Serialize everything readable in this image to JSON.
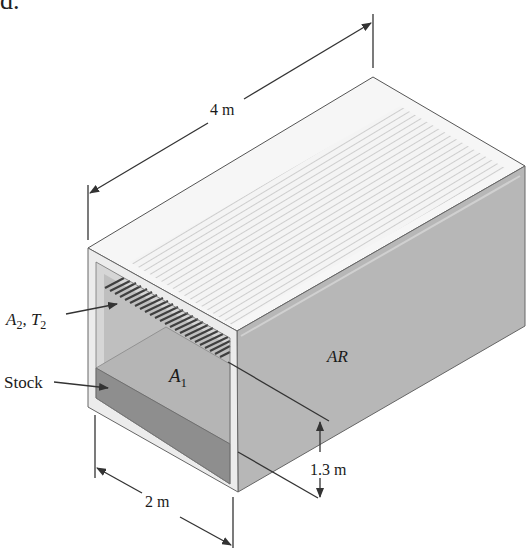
{
  "partial_text_top": "d.",
  "labels": {
    "length": "4 m",
    "width": "2 m",
    "height": "1.3 m",
    "stock": "Stock",
    "a1": "A",
    "a1_sub": "1",
    "a2": "A",
    "a2_sub": "2",
    "a2_sep": ", ",
    "t2": "T",
    "t2_sub": "2",
    "ar": "AR"
  },
  "colors": {
    "top_face": "#f2f2f2",
    "top_stripes": "#c9c9c9",
    "side_face": "#b4b4b4",
    "inner_back": "#bdbdbd",
    "stock_top": "#b9b9b9",
    "stock_front": "#8c8c8c",
    "hatch": "#4a4a4a",
    "frame": "#e6e6e6",
    "lines": "#333333"
  }
}
